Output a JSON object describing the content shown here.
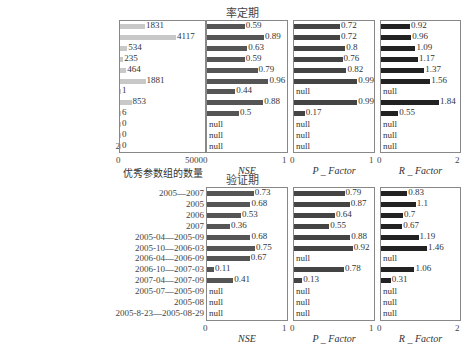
{
  "chart_data": [
    {
      "type": "bar",
      "orientation": "horizontal",
      "panel": "率定期 - 优秀参数组的数量",
      "title": "率定期",
      "xlabel": "优秀参数组的数量",
      "xlim": [
        0,
        5000
      ],
      "ticks": [
        "0",
        "5000"
      ],
      "categories": [
        "2005—2007",
        "2005",
        "2006",
        "2007",
        "2005-04—2005-09",
        "2005-10—2006-03",
        "2006-04—2006-09",
        "2006-10—2007-03",
        "2007-04—2007-09",
        "2005-07—2005-09",
        "2005-08",
        "2005-8-23—2005-08-29"
      ],
      "values": [
        1831,
        4117,
        534,
        235,
        464,
        1881,
        1,
        853,
        6,
        0,
        0,
        0
      ],
      "color": "#c8c8c8"
    },
    {
      "type": "bar",
      "orientation": "horizontal",
      "panel": "率定期 - NSE",
      "xlabel": "NSE",
      "xlim": [
        0,
        1
      ],
      "ticks": [
        "0",
        "1"
      ],
      "values": [
        0.59,
        0.89,
        0.63,
        0.59,
        0.79,
        0.96,
        0.44,
        0.88,
        0.5,
        null,
        null,
        null
      ],
      "labels": [
        "0.59",
        "0.89",
        "0.63",
        "0.59",
        "0.79",
        "0.96",
        "0.44",
        "0.88",
        "0.5",
        "null",
        "null",
        "null"
      ],
      "color": "#555555"
    },
    {
      "type": "bar",
      "orientation": "horizontal",
      "panel": "率定期 - P_Factor",
      "xlabel": "P _ Factor",
      "xlim": [
        0,
        1
      ],
      "ticks": [
        "0",
        "1"
      ],
      "values": [
        0.72,
        0.72,
        0.8,
        0.76,
        0.82,
        0.99,
        null,
        0.99,
        0.17,
        null,
        null,
        null
      ],
      "labels": [
        "0.72",
        "0.72",
        "0.8",
        "0.76",
        "0.82",
        "0.99",
        "null",
        "0.99",
        "0.17",
        "null",
        "null",
        "null"
      ],
      "color": "#444444"
    },
    {
      "type": "bar",
      "orientation": "horizontal",
      "panel": "率定期 - R_Factor",
      "xlabel": "R _ Factor",
      "xlim": [
        0,
        2
      ],
      "ticks": [
        "0",
        "2"
      ],
      "values": [
        0.92,
        0.96,
        1.09,
        1.17,
        1.37,
        1.56,
        null,
        1.84,
        0.55,
        null,
        null,
        null
      ],
      "labels": [
        "0.92",
        "0.96",
        "1.09",
        "1.17",
        "1.37",
        "1.56",
        "null",
        "1.84",
        "0.55",
        "null",
        "null",
        "null"
      ],
      "color": "#222222"
    },
    {
      "type": "bar",
      "orientation": "horizontal",
      "panel": "验证期 - NSE",
      "title": "验证期",
      "xlabel": "NSE",
      "xlim": [
        0,
        1
      ],
      "ticks": [
        "0",
        "1"
      ],
      "categories": [
        "2005—2007",
        "2005",
        "2006",
        "2007",
        "2005-04—2005-09",
        "2005-10—2006-03",
        "2006-04—2006-09",
        "2006-10—2007-03",
        "2007-04—2007-09",
        "2005-07—2005-09",
        "2005-08",
        "2005-8-23—2005-08-29"
      ],
      "values": [
        0.73,
        0.68,
        0.53,
        0.36,
        0.68,
        0.75,
        0.67,
        0.11,
        0.41,
        null,
        null,
        null
      ],
      "labels": [
        "0.73",
        "0.68",
        "0.53",
        "0.36",
        "0.68",
        "0.75",
        "0.67",
        "0.11",
        "0.41",
        "null",
        "null",
        "null"
      ],
      "color": "#555555"
    },
    {
      "type": "bar",
      "orientation": "horizontal",
      "panel": "验证期 - P_Factor",
      "xlabel": "P _ Factor",
      "xlim": [
        0,
        1
      ],
      "ticks": [
        "0",
        "1"
      ],
      "values": [
        0.79,
        0.87,
        0.64,
        0.55,
        0.88,
        0.92,
        null,
        0.78,
        0.13,
        null,
        null,
        null
      ],
      "labels": [
        "0.79",
        "0.87",
        "0.64",
        "0.55",
        "0.88",
        "0.92",
        "null",
        "0.78",
        "0.13",
        "null",
        "null",
        "null"
      ],
      "color": "#444444"
    },
    {
      "type": "bar",
      "orientation": "horizontal",
      "panel": "验证期 - R_Factor",
      "xlabel": "R _ Factor",
      "xlim": [
        0,
        2
      ],
      "ticks": [
        "0",
        "2"
      ],
      "values": [
        0.83,
        1.1,
        0.7,
        0.67,
        1.19,
        1.46,
        null,
        1.06,
        0.31,
        null,
        null,
        null
      ],
      "labels": [
        "0.83",
        "1.1",
        "0.7",
        "0.67",
        "1.19",
        "1.46",
        "null",
        "1.06",
        "0.31",
        "null",
        "null",
        "null"
      ],
      "color": "#222222"
    }
  ],
  "titles": {
    "top": "率定期",
    "bottom": "验证期"
  },
  "axis_labels": {
    "count": "优秀参数组的数量",
    "nse": "NSE",
    "p": "P _ Factor",
    "r": "R _ Factor"
  },
  "ticks": {
    "count": [
      "0",
      "5000"
    ],
    "nse": [
      "0",
      "1"
    ],
    "p": [
      "0",
      "1"
    ],
    "r": [
      "0",
      "2"
    ]
  },
  "categories": [
    "2005—2007",
    "2005",
    "2006",
    "2007",
    "2005-04—2005-09",
    "2005-10—2006-03",
    "2006-04—2006-09",
    "2006-10—2007-03",
    "2007-04—2007-09",
    "2005-07—2005-09",
    "2005-08",
    "2005-8-23—2005-08-29"
  ]
}
